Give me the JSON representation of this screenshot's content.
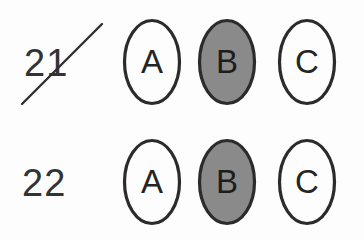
{
  "sheet": {
    "title": "Multiple choice answer rows",
    "background_color": "#fdfdfd",
    "ink_color": "#2b2b2b",
    "shaded_fill_color": "#8a8a8a"
  },
  "rows": [
    {
      "number": "21",
      "struck_through": true,
      "strike_mark": {
        "type": "diagonal-pen-stroke",
        "x1": 22,
        "y1": 104,
        "x2": 102,
        "y2": 24,
        "color": "#2f2f2f",
        "width": 2.4
      },
      "options": [
        {
          "letter": "A",
          "filled": false
        },
        {
          "letter": "B",
          "filled": true
        },
        {
          "letter": "C",
          "filled": false
        }
      ]
    },
    {
      "number": "22",
      "struck_through": false,
      "options": [
        {
          "letter": "A",
          "filled": false
        },
        {
          "letter": "B",
          "filled": true
        },
        {
          "letter": "C",
          "filled": false
        }
      ]
    }
  ]
}
